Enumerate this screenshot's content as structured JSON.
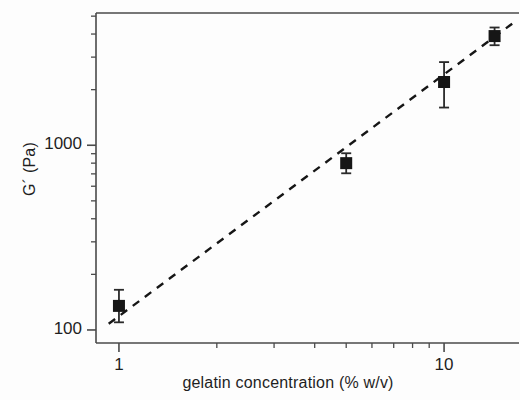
{
  "chart_data": {
    "type": "scatter",
    "title": "",
    "xlabel": "gelatin concentration (% w/v)",
    "ylabel": "G´ (Pa)",
    "xscale": "log",
    "yscale": "log",
    "xlim": [
      0.85,
      17
    ],
    "ylim": [
      85,
      5200
    ],
    "grid": false,
    "legend": null,
    "xticks": [
      {
        "value": 1,
        "label": "1"
      },
      {
        "value": 10,
        "label": "10"
      }
    ],
    "yticks": [
      {
        "value": 100,
        "label": "100"
      },
      {
        "value": 1000,
        "label": "1000"
      }
    ],
    "x_minor_ticks": [
      2,
      3,
      4,
      5,
      6,
      7,
      8,
      9,
      20,
      30
    ],
    "y_minor_ticks": [
      200,
      300,
      400,
      500,
      600,
      700,
      800,
      900,
      2000,
      3000,
      4000,
      5000
    ],
    "series": [
      {
        "name": "G´ vs gelatin concentration",
        "marker": "filled-square",
        "marker_color": "#161616",
        "errorbar_color": "#2a2a2a",
        "points": [
          {
            "x": 1,
            "y": 135,
            "yerr_low": 25,
            "yerr_high": 30
          },
          {
            "x": 5,
            "y": 800,
            "yerr_low": 95,
            "yerr_high": 105
          },
          {
            "x": 10,
            "y": 2200,
            "yerr_low": 600,
            "yerr_high": 620
          },
          {
            "x": 14.3,
            "y": 3900,
            "yerr_low": 420,
            "yerr_high": 440
          }
        ]
      }
    ],
    "fit_line": {
      "name": "power-law fit",
      "style": "dashed",
      "color": "#161616",
      "x_start": 0.93,
      "y_start": 108,
      "x_end": 16.2,
      "y_end": 4550
    }
  }
}
